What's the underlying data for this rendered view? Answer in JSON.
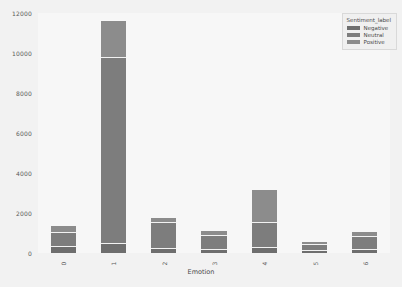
{
  "chart_data": {
    "type": "bar",
    "subtype": "stacked-bar",
    "title": "",
    "xlabel": "Emotion",
    "ylabel": "",
    "categories": [
      "0",
      "1",
      "2",
      "3",
      "4",
      "5",
      "6"
    ],
    "ylim": [
      0,
      12000
    ],
    "yticks": [
      0,
      2000,
      4000,
      6000,
      8000,
      10000,
      12000
    ],
    "ytick_labels": [
      "0",
      "2000",
      "4000",
      "6000",
      "8000",
      "10000",
      "12000"
    ],
    "grid": false,
    "legend_position": "upper right",
    "legend_title": "Sentiment_label",
    "series": [
      {
        "name": "Negative",
        "color": "#6e6e6e",
        "values": [
          310,
          430,
          200,
          150,
          230,
          120,
          170
        ]
      },
      {
        "name": "Neutral",
        "color": "#7d7d7d",
        "values": [
          690,
          9330,
          1320,
          690,
          1290,
          290,
          640
        ]
      },
      {
        "name": "Positive",
        "color": "#8c8c8c",
        "values": [
          330,
          1840,
          230,
          270,
          1630,
          160,
          260
        ]
      }
    ],
    "totals": [
      1330,
      11600,
      1750,
      1110,
      3150,
      570,
      1070
    ]
  },
  "legend": {
    "title": "Sentiment_label",
    "entries": [
      {
        "label": "Negative",
        "color": "#6e6e6e"
      },
      {
        "label": "Neutral",
        "color": "#7d7d7d"
      },
      {
        "label": "Positive",
        "color": "#8c8c8c"
      }
    ]
  },
  "axes": {
    "xlabel": "Emotion"
  }
}
